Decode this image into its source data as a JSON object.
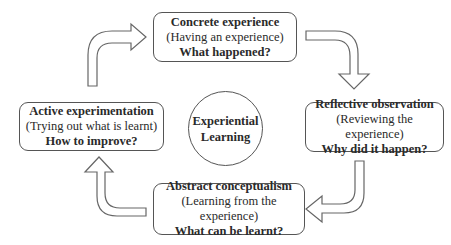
{
  "diagram": {
    "center": {
      "line1": "Experiential",
      "line2": "Learning"
    },
    "stages": {
      "top": {
        "title": "Concrete experience",
        "subtitle": "(Having an experience)",
        "question": "What happened?"
      },
      "right": {
        "title": "Reflective observation",
        "subtitle": "(Reviewing the experience)",
        "question": "Why did it happen?"
      },
      "bottom": {
        "title": "Abstract conceptualism",
        "subtitle": "(Learning from the experience)",
        "question": "What can be learnt?"
      },
      "left": {
        "title": "Active experimentation",
        "subtitle": "(Trying out what is learnt)",
        "question": "How to improve?"
      }
    },
    "flow": [
      "top",
      "right",
      "bottom",
      "left",
      "top"
    ],
    "colors": {
      "stroke": "#555555",
      "text": "#2a2a2a",
      "background": "#ffffff"
    }
  }
}
